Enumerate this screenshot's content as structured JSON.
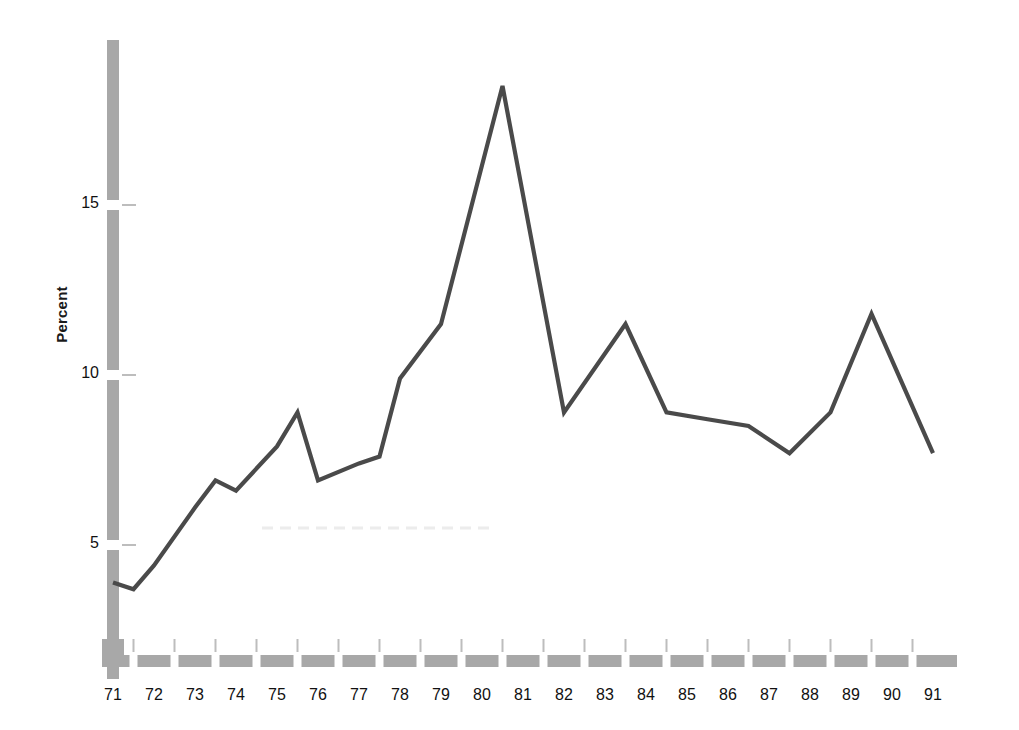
{
  "chart_data": {
    "type": "line",
    "title": "",
    "subtitle": "",
    "xlabel": "",
    "ylabel": "Percent",
    "x": [
      71,
      71.5,
      72,
      73,
      73.5,
      74,
      75,
      75.5,
      76,
      77,
      77.5,
      78,
      79,
      80.5,
      82,
      83.5,
      84.5,
      85.5,
      86.5,
      87.5,
      88.5,
      89.5,
      91
    ],
    "values": [
      3.9,
      3.7,
      4.4,
      6.1,
      6.9,
      6.6,
      7.9,
      8.9,
      6.9,
      7.4,
      7.6,
      9.9,
      11.5,
      18.5,
      8.9,
      11.5,
      8.9,
      8.7,
      8.5,
      7.7,
      8.9,
      11.8,
      7.7
    ],
    "series": [
      {
        "name": "Percent",
        "x": [
          71,
          71.5,
          72,
          73,
          73.5,
          74,
          75,
          75.5,
          76,
          77,
          77.5,
          78,
          79,
          80.5,
          82,
          83.5,
          84.5,
          85.5,
          86.5,
          87.5,
          88.5,
          89.5,
          91
        ],
        "values": [
          3.9,
          3.7,
          4.4,
          6.1,
          6.9,
          6.6,
          7.9,
          8.9,
          6.9,
          7.4,
          7.6,
          9.9,
          11.5,
          18.5,
          8.9,
          11.5,
          8.9,
          8.7,
          8.5,
          7.7,
          8.9,
          11.8,
          7.7
        ],
        "color": "#4a4a4a"
      }
    ],
    "xlim": [
      70.6,
      91.6
    ],
    "ylim": [
      2.4,
      19.9
    ],
    "x_tick_labels": [
      "71",
      "72",
      "73",
      "74",
      "75",
      "76",
      "77",
      "78",
      "79",
      "80",
      "81",
      "82",
      "83",
      "84",
      "85",
      "86",
      "87",
      "88",
      "89",
      "90",
      "91"
    ],
    "x_ticks": [
      71,
      72,
      73,
      74,
      75,
      76,
      77,
      78,
      79,
      80,
      81,
      82,
      83,
      84,
      85,
      86,
      87,
      88,
      89,
      90,
      91
    ],
    "y_ticks": [
      5,
      10,
      15
    ],
    "y_tick_labels": [
      "5",
      "10",
      "15"
    ],
    "grid": false,
    "legend": false,
    "legend_position": "none",
    "annotations": [],
    "peak_label": "18.5",
    "peak_year": "80"
  },
  "style": {
    "line_color": "#4a4a4a",
    "axis_color": "#a8a8a8",
    "tick_mark_color": "#bdbdbd",
    "text_color": "#111111",
    "background": "#ffffff",
    "artifact_color": "#ececec"
  },
  "labels": {
    "y_axis_title": "Percent"
  }
}
